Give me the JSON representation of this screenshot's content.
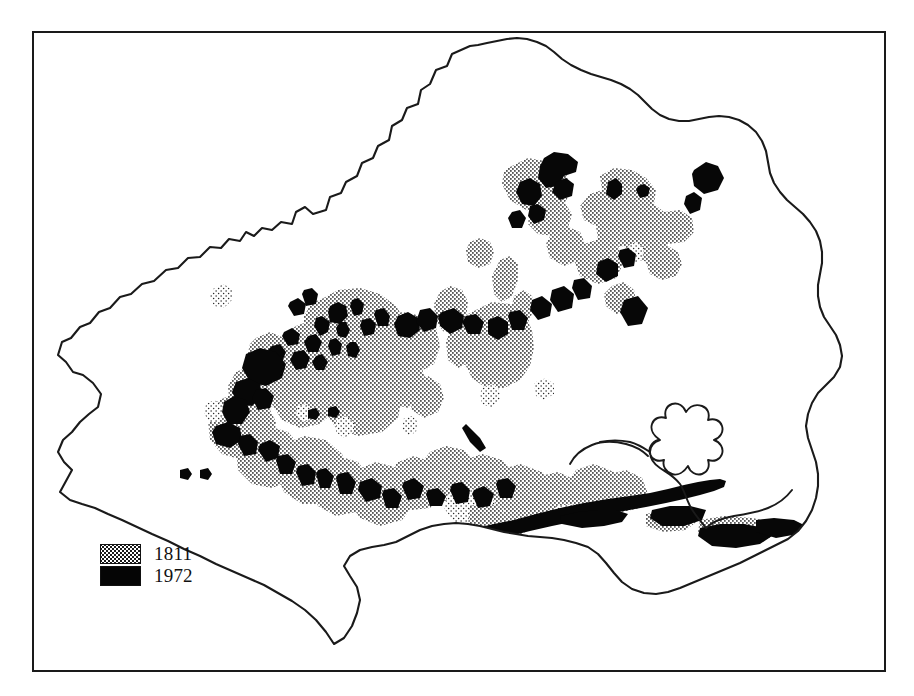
{
  "figure": {
    "kind": "map",
    "frame_border_color": "#1a1a1a",
    "background_color": "#ffffff"
  },
  "legend": {
    "name": "map-legend",
    "entries": [
      {
        "label": "1811",
        "swatch": "stipple",
        "color": "#1a1a1a",
        "meaning": "heathland extent in 1811"
      },
      {
        "label": "1972",
        "swatch": "solid",
        "color": "#050505",
        "meaning": "heathland extent in 1972"
      }
    ]
  },
  "caption": {
    "text": ""
  },
  "map_data": {
    "type": "choropleth-outline",
    "region_outline_color": "#1a1a1a",
    "series": [
      {
        "name": "1811",
        "fill": "stipple",
        "description": "Extensive stippled patches across the central and southern interior, north-east uplands and along the south coast."
      },
      {
        "name": "1972",
        "fill": "solid-black",
        "description": "Small fragmented black remnants scattered within the former 1811 stippled areas, plus a continuous ribbon along the south coast and near the large eastern harbour."
      }
    ]
  }
}
